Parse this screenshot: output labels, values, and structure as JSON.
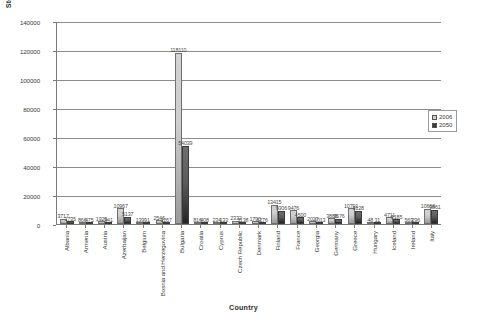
{
  "chart_data": {
    "type": "bar",
    "title": "",
    "xlabel": "Country",
    "ylabel": "Storage Capacity (mcm)",
    "ylim": [
      0,
      140000
    ],
    "yticks": [
      0,
      20000,
      40000,
      60000,
      80000,
      100000,
      120000,
      140000
    ],
    "grid": true,
    "legend_position": "right",
    "categories": [
      "Albania",
      "Armenia",
      "Austria",
      "Azerbaijan",
      "Belgium",
      "Bosnia and Herzegovina",
      "Bulgaria",
      "Croatia",
      "Cyprus",
      "Czech Republic",
      "Denmark",
      "Finland",
      "France",
      "Georgia",
      "Germany",
      "Greece",
      "Hungary",
      "Iceland",
      "Ireland",
      "Italy"
    ],
    "series": [
      {
        "name": "2006",
        "color": "#cfcfcf",
        "values": [
          3717,
          866,
          1929,
          10967,
          139,
          2546,
          118110,
          816,
          234,
          2332,
          1790,
          13415,
          9476,
          2027,
          3886,
          10791,
          48,
          4711,
          569,
          10666
        ]
      },
      {
        "name": "2050",
        "color": "#3a3a3a",
        "values": [
          1735,
          475,
          941,
          5137,
          91,
          1267,
          54039,
          408,
          133,
          1138,
          1276,
          9306,
          4500,
          1013,
          3676,
          9128,
          31,
          3185,
          296,
          9861
        ]
      }
    ]
  },
  "legend": {
    "items": [
      {
        "label": "2006",
        "color": "#cfcfcf"
      },
      {
        "label": "2050",
        "color": "#3a3a3a"
      }
    ]
  }
}
